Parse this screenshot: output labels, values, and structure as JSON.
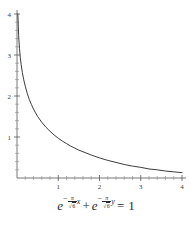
{
  "figure": {
    "background_color": "#ffffff",
    "axis_color": "#555555",
    "curve_color": "#3c3c3c"
  },
  "caption": {
    "equation_plain": "e^(-pi/sqrt(6) x) + e^(-pi/sqrt(6) y) = 1",
    "base": "e",
    "minus": "−",
    "pi": "π",
    "radical": "√",
    "radicand": "6",
    "var_x": "x",
    "var_y": "y",
    "plus": "+",
    "equals": "=",
    "rhs": "1"
  },
  "chart_data": {
    "type": "line",
    "title": "",
    "subtitle": "",
    "xlabel": "",
    "ylabel": "",
    "xlim": [
      0,
      4
    ],
    "ylim": [
      0,
      4
    ],
    "grid": false,
    "legend": "none",
    "legend_position": "none",
    "x_ticks": [
      1,
      2,
      3,
      4
    ],
    "x_tick_labels": [
      "1",
      "2",
      "3",
      "4"
    ],
    "y_ticks": [
      1,
      2,
      3,
      4
    ],
    "y_tick_labels": [
      "1",
      "2",
      "3",
      "4"
    ],
    "x_minor_tick_step": 0.2,
    "y_minor_tick_step": 0.2,
    "series": [
      {
        "name": "e^(-pi x/sqrt6) + e^(-pi y/sqrt6) = 1",
        "x": [
          0.02,
          0.04,
          0.06,
          0.08,
          0.1,
          0.13,
          0.16,
          0.2,
          0.25,
          0.3,
          0.35,
          0.4,
          0.45,
          0.5,
          0.6,
          0.7,
          0.8,
          0.9,
          1.0,
          1.1,
          1.2,
          1.3,
          1.4,
          1.5,
          1.6,
          1.8,
          2.0,
          2.2,
          2.4,
          2.6,
          2.8,
          3.0,
          3.2,
          3.4,
          3.6,
          3.8,
          4.0
        ],
        "y": [
          4.0,
          3.47,
          3.16,
          2.94,
          2.77,
          2.57,
          2.41,
          2.24,
          2.06,
          1.91,
          1.79,
          1.68,
          1.59,
          1.5,
          1.36,
          1.24,
          1.14,
          1.05,
          0.97,
          0.9,
          0.84,
          0.78,
          0.73,
          0.68,
          0.64,
          0.56,
          0.49,
          0.43,
          0.38,
          0.33,
          0.29,
          0.26,
          0.22,
          0.2,
          0.17,
          0.15,
          0.13
        ]
      }
    ]
  }
}
